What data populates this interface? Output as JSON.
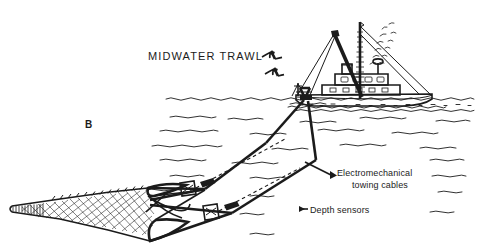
{
  "figure": {
    "kind": "line-illustration",
    "background_color": "#ffffff",
    "ink_color": "#1b1b1b",
    "title": "MIDWATER TRAWL",
    "panel_letter": "B"
  },
  "labels": {
    "title": "MIDWATER TRAWL",
    "panel": "B",
    "cables_line1": "Electromechanical",
    "cables_line2": "towing cables",
    "sensors": "Depth sensors"
  },
  "scene": {
    "vessel": {
      "name": "fishing-trawler",
      "features": [
        "mast",
        "rigging",
        "wheelhouse",
        "stack-smoke",
        "stern-gantry",
        "hull"
      ]
    },
    "birds": {
      "name": "seagulls",
      "count": 2
    },
    "water": {
      "name": "sea-surface",
      "surface_style": "wavy-line",
      "subsurface_style": "horizontal-dashed-waves"
    },
    "net": {
      "name": "trawl-net",
      "features": [
        "cod-end",
        "tapered-body",
        "mesh-texture",
        "net-mouth",
        "bridle-lines"
      ]
    },
    "sensors": [
      {
        "name": "depth-sensor-upper",
        "marker": "box"
      },
      {
        "name": "depth-sensor-lower",
        "marker": "box"
      }
    ],
    "cables": [
      {
        "name": "towing-cable-upper"
      },
      {
        "name": "towing-cable-lower"
      }
    ]
  }
}
